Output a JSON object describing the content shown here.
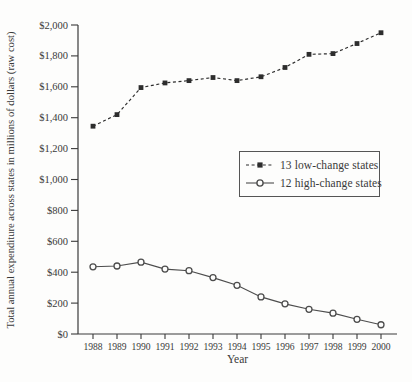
{
  "figure": {
    "background": "#fdfdfc",
    "text_color": "#3a3a3a",
    "axis_color": "#3a3a3a"
  },
  "chart_data": {
    "type": "line",
    "title": "",
    "xlabel": "Year",
    "ylabel": "Total annual expenditure across states in millions of dollars (raw cost)",
    "x_tick_labels": [
      "1988",
      "1989",
      "1990",
      "1991",
      "1992",
      "1993",
      "1994",
      "1995",
      "1996",
      "1997",
      "1998",
      "1999",
      "2000"
    ],
    "ylim": [
      0,
      2000
    ],
    "ytick_step": 200,
    "y_tick_labels": [
      "$0",
      "$200",
      "$400",
      "$600",
      "$800",
      "$1,000",
      "$1,200",
      "$1,400",
      "$1,600",
      "$1,800",
      "$2,000"
    ],
    "grid": false,
    "legend_position": "middle-right",
    "series": [
      {
        "name": "13 low-change states",
        "marker": "filled-square",
        "line_style": "dashed",
        "color": "#2d2d2d",
        "values": [
          1345,
          1420,
          1595,
          1625,
          1640,
          1660,
          1640,
          1665,
          1725,
          1810,
          1815,
          1880,
          1950
        ]
      },
      {
        "name": "12 high-change states",
        "marker": "open-circle",
        "line_style": "solid",
        "color": "#4d4d4d",
        "values": [
          435,
          440,
          465,
          420,
          410,
          365,
          315,
          240,
          195,
          160,
          135,
          95,
          60
        ]
      }
    ]
  }
}
